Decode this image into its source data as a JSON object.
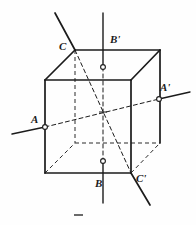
{
  "figure": {
    "kind": "geometry-diagram",
    "background_color": "#fefefe",
    "ink_color": "#1b1b1b",
    "labels": [
      {
        "id": "C",
        "text": "C",
        "x": 59,
        "y": 41
      },
      {
        "id": "Bp",
        "text": "B'",
        "x": 110,
        "y": 34
      },
      {
        "id": "Ap",
        "text": "A'",
        "x": 160,
        "y": 82
      },
      {
        "id": "A",
        "text": "A",
        "x": 31,
        "y": 114
      },
      {
        "id": "B",
        "text": "B",
        "x": 95,
        "y": 178
      },
      {
        "id": "Cp",
        "text": "C'",
        "x": 136,
        "y": 173
      }
    ],
    "cube": {
      "front_top_left": [
        45,
        80
      ],
      "front_top_right": [
        131,
        80
      ],
      "front_bot_left": [
        45,
        173
      ],
      "front_bot_right": [
        131,
        173
      ],
      "back_top_left": [
        75,
        50
      ],
      "back_top_right": [
        160,
        50
      ],
      "back_bot_left": [
        75,
        143
      ],
      "back_bot_right": [
        160,
        143
      ],
      "center": [
        103,
        112
      ]
    },
    "axes": [
      {
        "id": "axis-AA",
        "from": [
          12,
          134
        ],
        "to": [
          190,
          95
        ],
        "style": "dashed-through-solid-ends"
      },
      {
        "id": "axis-BB",
        "from": [
          103,
          13
        ],
        "to": [
          103,
          203
        ],
        "style": "dashed-through-solid-ends"
      },
      {
        "id": "axis-CC",
        "from": [
          55,
          13
        ],
        "to": [
          150,
          205
        ],
        "style": "solid-ends-dashed-middle"
      }
    ],
    "markers": [
      {
        "id": "marker-Bp-top-face",
        "x": 103,
        "y": 67
      },
      {
        "id": "marker-B-bottom-face",
        "x": 103,
        "y": 161
      },
      {
        "id": "marker-Ap-right-face",
        "x": 159,
        "y": 99
      },
      {
        "id": "marker-A-left-face",
        "x": 45,
        "y": 127
      }
    ],
    "footer_dash": {
      "x": 74,
      "y": 214,
      "width": 9,
      "height": 2
    }
  }
}
